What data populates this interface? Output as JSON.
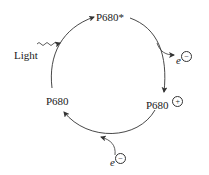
{
  "diagram": {
    "nodes": {
      "top": "P680*",
      "right": "P680",
      "right_charge": "+",
      "left": "P680"
    },
    "inputs": {
      "light": "Light",
      "electron_in": "e",
      "electron_in_charge": "−"
    },
    "outputs": {
      "electron_out": "e",
      "electron_out_charge": "−"
    },
    "colors": {
      "stroke": "#333333",
      "text": "#1a1a1a"
    }
  }
}
